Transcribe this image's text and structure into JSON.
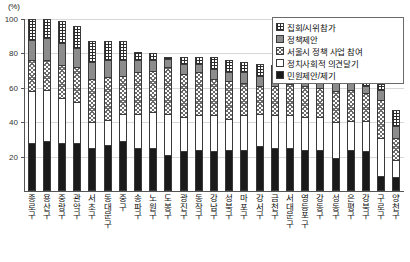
{
  "chart_data": {
    "type": "bar",
    "subtype": "stacked-column-100",
    "title": "",
    "xlabel": "",
    "ylabel": "(%)",
    "ylim": [
      0,
      100
    ],
    "yticks": [
      20,
      40,
      60,
      80,
      100
    ],
    "grid": true,
    "legend_position": "top-right",
    "categories": [
      "종로구",
      "용산구",
      "중랑구",
      "관악구",
      "서초구",
      "동대문구",
      "중구",
      "송파구",
      "노원구",
      "도봉구",
      "광진구",
      "동작구",
      "강남구",
      "성북구",
      "마포구",
      "강서구",
      "금천구",
      "서대문구",
      "영등포구",
      "강동구",
      "성동구",
      "은평구",
      "강북구",
      "구로구",
      "양천구"
    ],
    "series": [
      {
        "name": "민원제안/제기",
        "pattern": "solid-black",
        "values": [
          28,
          29,
          28,
          28,
          25,
          27,
          29,
          25,
          25,
          21,
          23,
          24,
          23,
          24,
          24,
          26,
          25,
          25,
          24,
          24,
          19,
          24,
          23,
          9,
          8
        ]
      },
      {
        "name": "정치사회적 의견달기",
        "pattern": "white",
        "values": [
          30,
          30,
          26,
          24,
          15,
          14,
          16,
          20,
          21,
          24,
          20,
          20,
          21,
          18,
          20,
          19,
          19,
          19,
          19,
          19,
          21,
          17,
          18,
          22,
          10
        ]
      },
      {
        "name": "서울시 정책 사업 참여",
        "pattern": "diagonal-crosshatch",
        "values": [
          18,
          17,
          19,
          20,
          25,
          25,
          22,
          24,
          24,
          27,
          25,
          25,
          21,
          22,
          19,
          16,
          17,
          18,
          18,
          17,
          18,
          18,
          16,
          22,
          13
        ]
      },
      {
        "name": "정책제안",
        "pattern": "solid-gray",
        "values": [
          12,
          13,
          13,
          11,
          10,
          10,
          9,
          7,
          6,
          5,
          6,
          5,
          6,
          5,
          6,
          6,
          5,
          5,
          5,
          5,
          5,
          5,
          4,
          6,
          7
        ]
      },
      {
        "name": "집회/시위참가",
        "pattern": "checker",
        "values": [
          12,
          11,
          13,
          13,
          12,
          11,
          11,
          5,
          4,
          1,
          4,
          4,
          7,
          7,
          6,
          7,
          7,
          6,
          6,
          6,
          6,
          5,
          5,
          3,
          9
        ]
      }
    ]
  },
  "legend": {
    "items": [
      {
        "label": "집회/시위참가",
        "swatch": "checker-swatch"
      },
      {
        "label": "정책제안",
        "swatch": "solid-gray-swatch"
      },
      {
        "label": "서울시 정책 사업 참여",
        "swatch": "diagonal-crosshatch-swatch"
      },
      {
        "label": "정치사회적 의견달기",
        "swatch": "white-swatch"
      },
      {
        "label": "민원제안/제기",
        "swatch": "solid-black-swatch"
      }
    ]
  },
  "axis": {
    "unit": "(%)",
    "ytick_labels": [
      "20",
      "40",
      "60",
      "80",
      "100"
    ]
  },
  "colors": {
    "black_segment": "#1a1a1a",
    "gray_segment": "#8c8c8c",
    "white_segment": "#ffffff",
    "outline": "#3a3a3a",
    "gridline": "#d8d8d8"
  }
}
